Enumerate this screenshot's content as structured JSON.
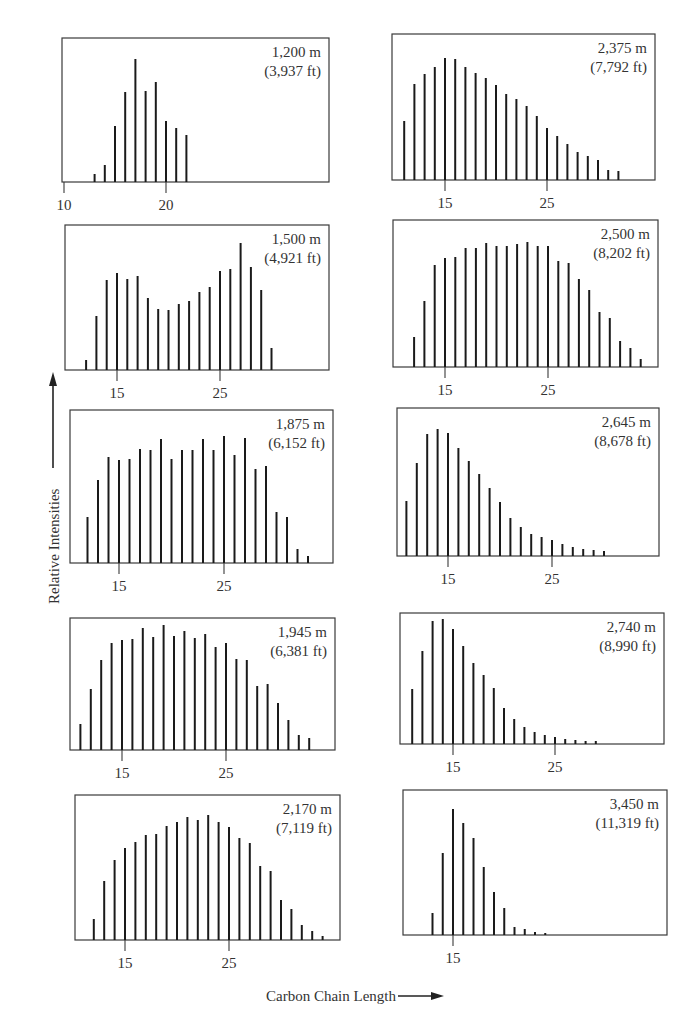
{
  "figure": {
    "x_axis_label": "Carbon Chain Length",
    "y_axis_label": "Relative Intensities"
  },
  "chart_data": [
    {
      "type": "bar",
      "title": "1,200 m (3,937 ft)",
      "depth_m": "1,200 m",
      "depth_ft": "(3,937 ft)",
      "xlabel": "Carbon Chain Length",
      "ylabel": "Relative Intensities",
      "box": {
        "left": 62,
        "top": 38,
        "right": 329,
        "baseline": 182
      },
      "ticks": [
        {
          "value": 10,
          "x": 64,
          "label": "10"
        },
        {
          "value": 20,
          "x": 166,
          "label": "20"
        }
      ],
      "start_carbon": 13,
      "values": [
        8,
        17,
        56,
        90,
        123,
        91,
        100,
        61,
        54,
        47
      ]
    },
    {
      "type": "bar",
      "title": "2,375 m (7,792 ft)",
      "depth_m": "2,375 m",
      "depth_ft": "(7,792 ft)",
      "box": {
        "left": 392,
        "top": 34,
        "right": 655,
        "baseline": 180
      },
      "ticks": [
        {
          "value": 15,
          "x": 445,
          "label": "15"
        },
        {
          "value": 25,
          "x": 547,
          "label": "25"
        }
      ],
      "start_carbon": 11,
      "values": [
        59,
        96,
        106,
        113,
        122,
        121,
        113,
        107,
        102,
        95,
        86,
        81,
        74,
        64,
        52,
        44,
        36,
        28,
        24,
        20,
        10,
        9
      ]
    },
    {
      "type": "bar",
      "title": "1,500 m (4,921 ft)",
      "depth_m": "1,500 m",
      "depth_ft": "(4,921 ft)",
      "box": {
        "left": 65,
        "top": 225,
        "right": 329,
        "baseline": 370
      },
      "ticks": [
        {
          "value": 15,
          "x": 117,
          "label": "15"
        },
        {
          "value": 25,
          "x": 220,
          "label": "25"
        }
      ],
      "start_carbon": 12,
      "values": [
        10,
        54,
        90,
        97,
        91,
        94,
        72,
        61,
        60,
        66,
        69,
        78,
        83,
        99,
        101,
        127,
        103,
        80,
        22
      ]
    },
    {
      "type": "bar",
      "title": "2,500 m (8,202 ft)",
      "depth_m": "2,500 m",
      "depth_ft": "(8,202 ft)",
      "box": {
        "left": 393,
        "top": 220,
        "right": 658,
        "baseline": 367
      },
      "ticks": [
        {
          "value": 15,
          "x": 445,
          "label": "15"
        },
        {
          "value": 25,
          "x": 548,
          "label": "25"
        }
      ],
      "start_carbon": 12,
      "values": [
        30,
        66,
        102,
        109,
        110,
        119,
        119,
        124,
        121,
        121,
        123,
        125,
        121,
        121,
        106,
        104,
        88,
        77,
        55,
        49,
        26,
        19,
        8
      ]
    },
    {
      "type": "bar",
      "title": "1,875 m (6,152 ft)",
      "depth_m": "1,875 m",
      "depth_ft": "(6,152 ft)",
      "box": {
        "left": 70,
        "top": 410,
        "right": 333,
        "baseline": 563
      },
      "ticks": [
        {
          "value": 15,
          "x": 119,
          "label": "15"
        },
        {
          "value": 25,
          "x": 224,
          "label": "25"
        }
      ],
      "start_carbon": 12,
      "values": [
        46,
        83,
        106,
        103,
        104,
        114,
        113,
        124,
        104,
        113,
        113,
        124,
        113,
        127,
        108,
        125,
        94,
        97,
        51,
        46,
        14,
        7
      ]
    },
    {
      "type": "bar",
      "title": "2,645 m (8,678 ft)",
      "depth_m": "2,645 m",
      "depth_ft": "(8,678 ft)",
      "box": {
        "left": 397,
        "top": 408,
        "right": 659,
        "baseline": 556
      },
      "ticks": [
        {
          "value": 15,
          "x": 448,
          "label": "15"
        },
        {
          "value": 25,
          "x": 552,
          "label": "25"
        }
      ],
      "start_carbon": 11,
      "values": [
        55,
        93,
        122,
        127,
        123,
        108,
        95,
        82,
        68,
        54,
        38,
        29,
        22,
        19,
        16,
        12,
        9,
        7,
        6,
        5
      ]
    },
    {
      "type": "bar",
      "title": "1,945 m (6,381 ft)",
      "depth_m": "1,945 m",
      "depth_ft": "(6,381 ft)",
      "box": {
        "left": 70,
        "top": 618,
        "right": 335,
        "baseline": 750
      },
      "ticks": [
        {
          "value": 15,
          "x": 122,
          "label": "15"
        },
        {
          "value": 25,
          "x": 226,
          "label": "25"
        }
      ],
      "start_carbon": 11,
      "values": [
        26,
        61,
        90,
        107,
        110,
        111,
        122,
        113,
        125,
        114,
        119,
        112,
        116,
        103,
        107,
        91,
        90,
        64,
        66,
        47,
        30,
        15,
        12
      ]
    },
    {
      "type": "bar",
      "title": "2,740 m (8,990 ft)",
      "depth_m": "2,740 m",
      "depth_ft": "(8,990 ft)",
      "box": {
        "left": 400,
        "top": 613,
        "right": 664,
        "baseline": 744
      },
      "ticks": [
        {
          "value": 15,
          "x": 453,
          "label": "15"
        },
        {
          "value": 25,
          "x": 555,
          "label": "25"
        }
      ],
      "start_carbon": 11,
      "values": [
        55,
        93,
        123,
        125,
        115,
        98,
        81,
        69,
        56,
        36,
        25,
        17,
        12,
        9,
        7,
        5,
        4,
        3,
        3
      ]
    },
    {
      "type": "bar",
      "title": "2,170 m (7,119 ft)",
      "depth_m": "2,170 m",
      "depth_ft": "(7,119 ft)",
      "box": {
        "left": 75,
        "top": 795,
        "right": 340,
        "baseline": 940
      },
      "ticks": [
        {
          "value": 15,
          "x": 125,
          "label": "15"
        },
        {
          "value": 25,
          "x": 229,
          "label": "25"
        }
      ],
      "start_carbon": 12,
      "values": [
        21,
        59,
        80,
        92,
        98,
        105,
        106,
        114,
        118,
        123,
        120,
        125,
        118,
        113,
        102,
        97,
        74,
        69,
        40,
        31,
        15,
        9,
        4
      ]
    },
    {
      "type": "bar",
      "title": "3,450 m (11,319 ft)",
      "depth_m": "3,450 m",
      "depth_ft": "(11,319 ft)",
      "box": {
        "left": 403,
        "top": 790,
        "right": 667,
        "baseline": 935
      },
      "ticks": [
        {
          "value": 15,
          "x": 453,
          "label": "15"
        }
      ],
      "start_carbon": 13,
      "values": [
        22,
        82,
        126,
        112,
        97,
        68,
        43,
        27,
        8,
        6,
        3,
        2
      ]
    }
  ],
  "colors": {
    "ink": "#1a1a1a",
    "frame": "#3a3a3a",
    "text": "#333333"
  }
}
